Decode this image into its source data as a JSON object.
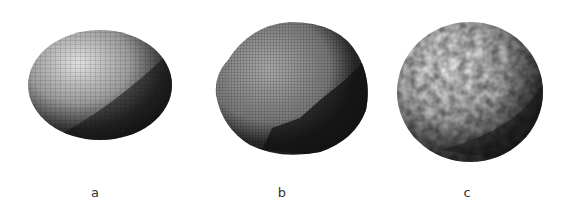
{
  "figure": {
    "panels": [
      {
        "id": "a",
        "label": "a",
        "description": "smooth ellipsoid with regular grid mesh"
      },
      {
        "id": "b",
        "label": "b",
        "description": "slightly irregular sphere with fine grid mesh"
      },
      {
        "id": "c",
        "label": "c",
        "description": "sphere with bumpy random surface texture"
      }
    ],
    "colors": {
      "background": "#ffffff",
      "highlight": "#d8d8d8",
      "midtone": "#8a8a8a",
      "shadow": "#1a1a1a",
      "label": "#333333"
    }
  }
}
